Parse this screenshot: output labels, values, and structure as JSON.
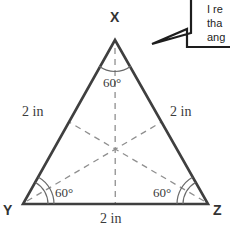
{
  "figure": {
    "type": "equilateral-triangle-diagram",
    "vertices": [
      {
        "name": "X",
        "label": "X",
        "x": 115,
        "y": 40,
        "label_x": 110,
        "label_y": 10
      },
      {
        "name": "Y",
        "label": "Y",
        "x": 23,
        "y": 204,
        "label_x": 3,
        "label_y": 203
      },
      {
        "name": "Z",
        "label": "Z",
        "x": 208,
        "y": 204,
        "label_x": 213,
        "label_y": 203
      }
    ],
    "sides": [
      {
        "name": "side-xy",
        "label": "2 in",
        "label_x": 22,
        "label_y": 105
      },
      {
        "name": "side-xz",
        "label": "2 in",
        "label_x": 170,
        "label_y": 105
      },
      {
        "name": "side-yz",
        "label": "2 in",
        "label_x": 100,
        "label_y": 212
      }
    ],
    "angles": [
      {
        "name": "angle-x",
        "label": "60°",
        "label_x": 103,
        "label_y": 76
      },
      {
        "name": "angle-y",
        "label": "60°",
        "label_x": 55,
        "label_y": 186
      },
      {
        "name": "angle-z",
        "label": "60°",
        "label_x": 153,
        "label_y": 186
      }
    ],
    "stroke_color": "#3f3f3f",
    "dash_color": "#8a8a8a"
  },
  "callout": {
    "name": "speech-bubble",
    "lines": [
      {
        "text": "I re",
        "x": 207,
        "y": 2
      },
      {
        "text": "tha",
        "x": 207,
        "y": 16
      },
      {
        "text": "ang",
        "x": 207,
        "y": 30
      }
    ],
    "stroke_color": "#1d1d1d"
  }
}
